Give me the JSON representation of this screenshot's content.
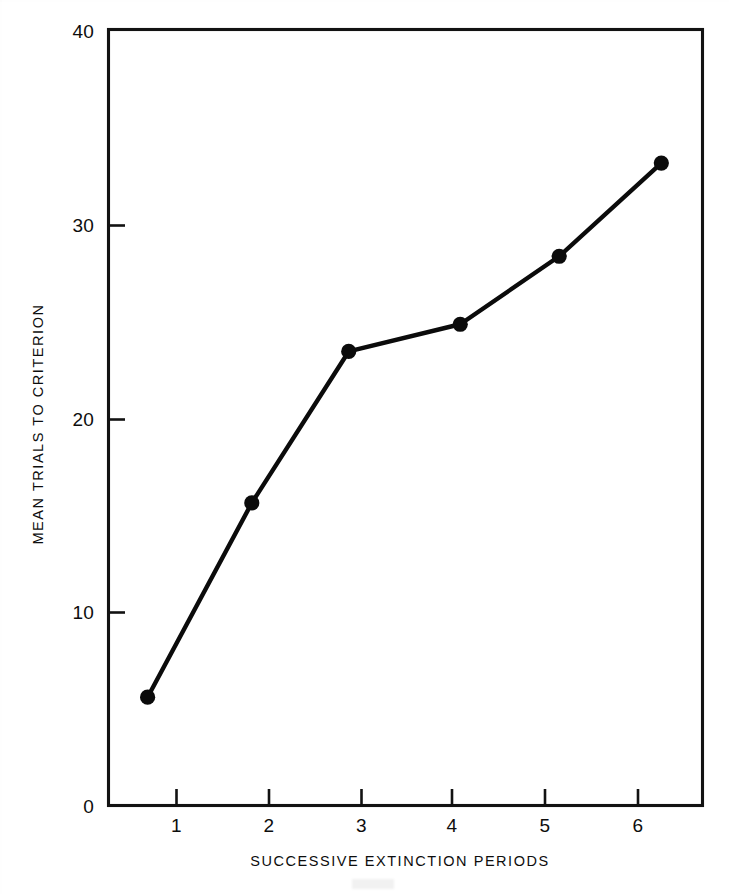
{
  "figure": {
    "background_color": "#ffffff",
    "ink_color": "#0b0b0b"
  },
  "chart_data": {
    "type": "line",
    "title": "",
    "subtitle": "",
    "xlabel": "SUCCESSIVE EXTINCTION PERIODS",
    "ylabel": "MEAN TRIALS TO CRITERION",
    "xlim": [
      0.62,
      6.33
    ],
    "ylim": [
      0,
      40
    ],
    "xticks": [
      1,
      2,
      3,
      4,
      5,
      6
    ],
    "xtick_labels": [
      "1",
      "2",
      "3",
      "4",
      "5",
      "6"
    ],
    "yticks": [
      0,
      10,
      20,
      30,
      40
    ],
    "ytick_labels": [
      "0",
      "10",
      "20",
      "30",
      "40"
    ],
    "grid": false,
    "legend": null,
    "legend_position": "none",
    "marker": "filled-circle",
    "categories": [
      "1",
      "2",
      "3",
      "4",
      "5",
      "6"
    ],
    "x": [
      1.0,
      2.0,
      2.93,
      4.0,
      4.95,
      5.93
    ],
    "values": [
      5.6,
      15.6,
      23.4,
      24.8,
      28.3,
      33.1
    ],
    "series": [
      {
        "name": "Mean trials to criterion",
        "x": [
          1.0,
          2.0,
          2.93,
          4.0,
          4.95,
          5.93
        ],
        "values": [
          5.6,
          15.6,
          23.4,
          24.8,
          28.3,
          33.1
        ]
      }
    ],
    "annotations": []
  },
  "axes": {
    "y_axis_title": "MEAN TRIALS TO CRITERION",
    "x_axis_title": "SUCCESSIVE EXTINCTION PERIODS",
    "y_tick_labels": [
      "40",
      "30",
      "20",
      "10",
      "0"
    ],
    "x_tick_labels": [
      "1",
      "2",
      "3",
      "4",
      "5",
      "6"
    ]
  }
}
